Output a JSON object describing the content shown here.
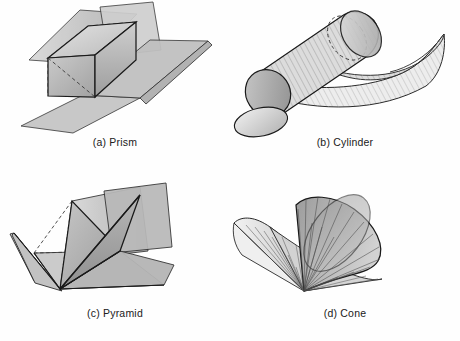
{
  "figure": {
    "background_color": "#fefefe",
    "stroke_color": "#1a1a1a",
    "hidden_line_style": "dashed",
    "panel_count": 4,
    "layout": "2x2 grid"
  },
  "panels": [
    {
      "id": "prism",
      "caption": "(a) Prism",
      "label_letter": "(a)",
      "shape_name": "Prism",
      "solid_type": "rectangular prism",
      "has_hidden_dashed_lines": true,
      "surface_shading": "flat gray faces",
      "fill_light": "#d9d9d9",
      "fill_mid": "#b4b4b4",
      "fill_dark": "#8f8f8f"
    },
    {
      "id": "cylinder",
      "caption": "(b) Cylinder",
      "label_letter": "(b)",
      "shape_name": "Cylinder",
      "solid_type": "circular cylinder",
      "has_hidden_dashed_lines": true,
      "surface_shading": "hatched ruled lines",
      "fill_light": "#e2e2e2",
      "fill_mid": "#b8b8b8",
      "fill_dark": "#949494"
    },
    {
      "id": "pyramid",
      "caption": "(c) Pyramid",
      "label_letter": "(c)",
      "shape_name": "Pyramid",
      "solid_type": "rectangular pyramid",
      "has_hidden_dashed_lines": true,
      "surface_shading": "flat gray faces",
      "fill_light": "#d4d4d4",
      "fill_mid": "#aeaeae",
      "fill_dark": "#8b8b8b"
    },
    {
      "id": "cone",
      "caption": "(d) Cone",
      "label_letter": "(d)",
      "shape_name": "Cone",
      "solid_type": "circular cone",
      "has_hidden_dashed_lines": false,
      "surface_shading": "radiating ruled lines from apex",
      "fill_light": "#ececec",
      "fill_mid": "#c0c0c0",
      "fill_dark": "#9a9a9a"
    }
  ]
}
